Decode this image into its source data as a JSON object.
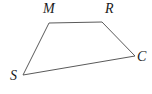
{
  "diagram": {
    "type": "geometry-quadrilateral",
    "background_color": "#ffffff",
    "line_color": "#5a5a5a",
    "label_color": "#1a1a1a",
    "polygon_points": "49,23 102,22 135,56 23,75",
    "vertices": [
      {
        "label": "M",
        "x": 49,
        "y": 23,
        "position": "top-left"
      },
      {
        "label": "R",
        "x": 102,
        "y": 22,
        "position": "top-right"
      },
      {
        "label": "C",
        "x": 135,
        "y": 56,
        "position": "right"
      },
      {
        "label": "S",
        "x": 23,
        "y": 75,
        "position": "bottom-left"
      }
    ]
  }
}
